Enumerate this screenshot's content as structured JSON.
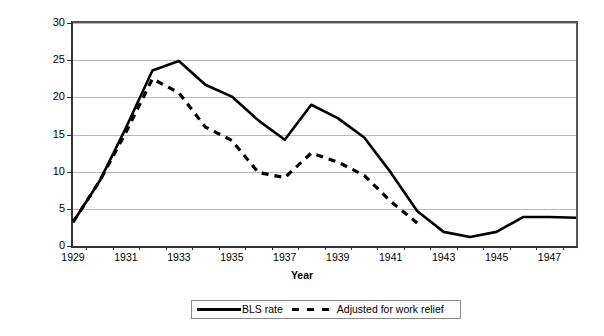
{
  "chart_data": {
    "type": "line",
    "title": "",
    "xlabel": "Year",
    "ylabel": "Percent of civilian labor force",
    "ylim": [
      0,
      30
    ],
    "ytick_values": [
      0,
      5,
      10,
      15,
      20,
      25,
      30
    ],
    "ytick_labels": [
      "0",
      "5",
      "10",
      "15",
      "20",
      "25",
      "30"
    ],
    "xlim": [
      1929,
      1948
    ],
    "x": [
      1929,
      1930,
      1931,
      1932,
      1933,
      1934,
      1935,
      1936,
      1937,
      1938,
      1939,
      1940,
      1941,
      1942,
      1943,
      1944,
      1945,
      1946,
      1947,
      1948
    ],
    "xtick_labels": [
      "1929",
      "1931",
      "1933",
      "1935",
      "1937",
      "1939",
      "1941",
      "1943",
      "1945",
      "1947"
    ],
    "xtick_values": [
      1929,
      1931,
      1933,
      1935,
      1937,
      1939,
      1941,
      1943,
      1945,
      1947
    ],
    "grid": "horizontal",
    "legend_position": "bottom-center",
    "series": [
      {
        "name": "BLS rate",
        "style": "solid",
        "color": "#000000",
        "values": [
          3.2,
          8.7,
          15.9,
          23.6,
          24.9,
          21.7,
          20.1,
          16.9,
          14.3,
          19.0,
          17.2,
          14.6,
          9.9,
          4.7,
          1.9,
          1.2,
          1.9,
          3.9,
          3.9,
          3.8
        ]
      },
      {
        "name": "Adjusted for work relief",
        "style": "dashed",
        "color": "#000000",
        "values": [
          3.2,
          8.7,
          15.3,
          22.5,
          20.6,
          16.0,
          14.2,
          9.9,
          9.2,
          12.5,
          11.3,
          9.5,
          6.0,
          3.1,
          null,
          null,
          null,
          null,
          null,
          null
        ]
      }
    ],
    "legend": [
      {
        "label": "BLS rate",
        "style": "solid"
      },
      {
        "label": "Adjusted for work relief",
        "style": "dashed"
      }
    ]
  }
}
